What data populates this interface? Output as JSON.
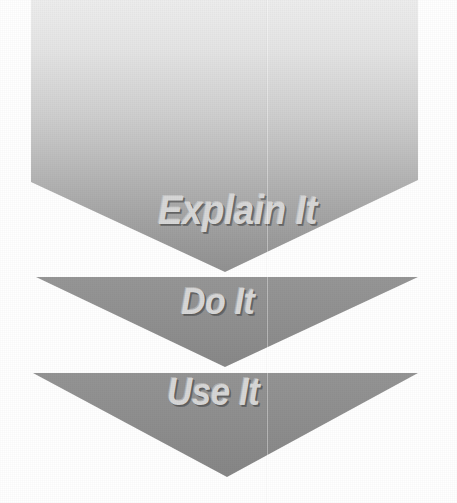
{
  "diagram": {
    "type": "process-flow-arrows",
    "orientation": "vertical-downward",
    "background_color": "#ffffff",
    "stage_count": 3,
    "stages": [
      {
        "id": "explain-it",
        "label": "Explain It",
        "shape": "pentagon-arrow",
        "order": 1,
        "fill_type": "linear-gradient",
        "fill_top_color": "#eaeaea",
        "fill_bottom_color": "#949494",
        "label_color": "#d7d7d7",
        "geometry": {
          "left": 31,
          "right": 418,
          "top": 0,
          "shoulder_y": 182,
          "apex_x": 225,
          "apex_y": 272
        }
      },
      {
        "id": "do-it",
        "label": "Do It",
        "shape": "chevron-triangle",
        "order": 2,
        "fill_type": "solid",
        "fill_color": "#8f8f8f",
        "label_color": "#d7d7d7",
        "geometry": {
          "left": 36,
          "right": 418,
          "top": 277,
          "apex_x": 225,
          "apex_y": 367
        }
      },
      {
        "id": "use-it",
        "label": "Use It",
        "shape": "chevron-triangle",
        "order": 3,
        "fill_type": "solid",
        "fill_color": "#8d8d8d",
        "label_color": "#d7d7d7",
        "geometry": {
          "left": 33,
          "right": 418,
          "top": 373,
          "apex_x": 227,
          "apex_y": 477
        }
      }
    ]
  }
}
